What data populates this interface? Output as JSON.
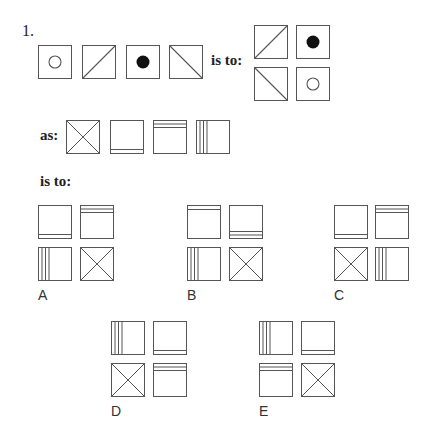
{
  "question": {
    "number": "1.",
    "phrase_is_to_1": "is to:",
    "phrase_as": "as:",
    "phrase_is_to_2": "is to:"
  },
  "stimulus_row": {
    "tiles": [
      "circle-open",
      "diag-up",
      "circle-filled",
      "diag-down"
    ]
  },
  "stimulus_grid": {
    "tiles": [
      "diag-up",
      "circle-filled",
      "diag-down",
      "circle-open"
    ]
  },
  "analogy_row": {
    "tiles": [
      "cross-x",
      "line-bottom-1",
      "lines-top-2",
      "lines-left-3"
    ]
  },
  "options": [
    {
      "label": "A",
      "tiles": [
        "line-bottom-1",
        "lines-top-2",
        "lines-left-3",
        "cross-x"
      ]
    },
    {
      "label": "B",
      "tiles": [
        "line-top-1",
        "lines-bottom-2",
        "lines-left-3",
        "cross-x"
      ]
    },
    {
      "label": "C",
      "tiles": [
        "line-bottom-1",
        "lines-top-2",
        "cross-x",
        "lines-left-3"
      ]
    },
    {
      "label": "D",
      "tiles": [
        "lines-left-3",
        "line-bottom-1",
        "cross-x",
        "lines-top-2"
      ]
    },
    {
      "label": "E",
      "tiles": [
        "lines-left-3",
        "line-bottom-1",
        "lines-top-2",
        "cross-x"
      ]
    }
  ],
  "colors": {
    "stroke": "#555555",
    "fill": "#111111",
    "text": "#222222"
  }
}
